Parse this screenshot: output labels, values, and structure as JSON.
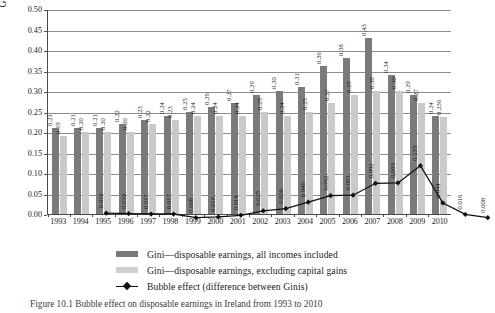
{
  "chart_data": {
    "type": "bar",
    "title": "",
    "xlabel": "",
    "ylabel": "Gini coefficients",
    "ylim": [
      0.0,
      0.5
    ],
    "ytick_step": 0.05,
    "grid": true,
    "legend_position": "bottom",
    "categories": [
      "1993",
      "1994",
      "1995",
      "1996",
      "1997",
      "1998",
      "1999",
      "2000",
      "2001",
      "2002",
      "2003",
      "2004",
      "2005",
      "2006",
      "2007",
      "2008",
      "2009",
      "2010"
    ],
    "ytick_labels": [
      "0.00",
      "0.05",
      "0.10",
      "0.15",
      "0.20",
      "0.25",
      "0.30",
      "0.35",
      "0.40",
      "0.45",
      "0.50"
    ],
    "series": [
      {
        "name": "Gini—disposable earnings, all incomes included",
        "type": "bar",
        "color": "#7a7a7a",
        "values": [
          0.21,
          0.21,
          0.21,
          0.22,
          0.23,
          0.24,
          0.25,
          0.26,
          0.27,
          0.29,
          0.3,
          0.31,
          0.36,
          0.38,
          0.43,
          0.34,
          0.29,
          0.24
        ],
        "labels": [
          "0.21",
          "0.21",
          "0.21",
          "0.22",
          "0.23",
          "0.24",
          "0.25",
          "0.26",
          "0.27",
          "0.29",
          "0.30",
          "0.31",
          "0.36",
          "0.38",
          "0.43",
          "0.34",
          "0.29",
          "0.24"
        ]
      },
      {
        "name": "Gini—disposable earnings, excluding capital gains",
        "type": "bar",
        "color": "#c9c9c9",
        "values": [
          0.19,
          0.2,
          0.2,
          0.2,
          0.22,
          0.23,
          0.24,
          0.24,
          0.24,
          0.25,
          0.24,
          0.25,
          0.27,
          0.29,
          0.3,
          0.3,
          0.27,
          0.236
        ],
        "labels": [
          "0.19",
          "0.20",
          "0.20",
          "0.20",
          "0.22",
          "0.23",
          "0.24",
          "0.24",
          "0.24",
          "0.25",
          "0.24",
          "0.25",
          "0.27",
          "0.29",
          "0.30",
          "0.30",
          "0.27",
          "0.236"
        ]
      },
      {
        "name": "Bubble effect (difference between Ginis)",
        "type": "line",
        "color": "#111111",
        "values": [
          0.019,
          0.018,
          0.017,
          0.017,
          0.008,
          0.01,
          0.014,
          0.025,
          0.03,
          0.046,
          0.062,
          0.063,
          0.092,
          0.093,
          0.135,
          0.044,
          0.016,
          0.008
        ],
        "labels": [
          "0.019",
          "0.018",
          "0.017",
          "0.017",
          "0.008",
          "0.010",
          "0.014",
          "0.025",
          "0.030",
          "0.046",
          "0.062",
          "0.063",
          "0.092",
          "0.093",
          "0.135",
          "0.044",
          "0.016",
          "0.008"
        ]
      }
    ]
  },
  "legend": {
    "items": [
      {
        "label": "Gini—disposable earnings, all incomes included",
        "marker": "dark-swatch"
      },
      {
        "label": "Gini—disposable earnings, excluding capital gains",
        "marker": "light-swatch"
      },
      {
        "label": "Bubble effect (difference between Ginis)",
        "marker": "line-diamond"
      }
    ]
  },
  "caption": {
    "text": "Figure 10.1  Bubble effect on disposable earnings in Ireland from 1993 to 2010"
  }
}
